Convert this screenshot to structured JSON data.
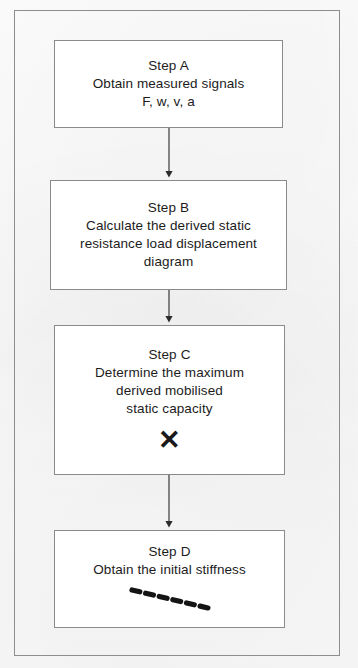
{
  "figure": {
    "type": "flowchart",
    "orientation": "vertical",
    "frame": {
      "stroke_color": "#8d8d8d"
    },
    "background_color": "#fdfdfd",
    "text_color": "#1c1c1c"
  },
  "steps": [
    {
      "id": "A",
      "title": "Step A",
      "lines": [
        "Obtain measured signals",
        "F, w, v, a"
      ],
      "marker": "none"
    },
    {
      "id": "B",
      "title": "Step B",
      "lines": [
        "Calculate the derived static",
        "resistance load displacement",
        "diagram"
      ],
      "marker": "none"
    },
    {
      "id": "C",
      "title": "Step C",
      "lines": [
        "Determine the maximum",
        "derived mobilised",
        "static capacity"
      ],
      "marker": "x-cross-symbol"
    },
    {
      "id": "D",
      "title": "Step D",
      "lines": [
        "Obtain the initial stiffness"
      ],
      "marker": "dashed-line-symbol"
    }
  ],
  "connectors": [
    {
      "from": "A",
      "to": "B",
      "style": "solid-arrow-down"
    },
    {
      "from": "B",
      "to": "C",
      "style": "solid-arrow-down"
    },
    {
      "from": "C",
      "to": "D",
      "style": "solid-arrow-down"
    }
  ]
}
